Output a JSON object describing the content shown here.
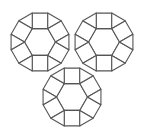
{
  "figure": {
    "title": "Trefoil arrangement of three rhombitrihexagonal rosettes",
    "background_color": "#ffffff",
    "stroke_color": "#555555",
    "stroke_width": 1.1,
    "fill_color": "#ffffff",
    "canvas": {
      "width": 144,
      "height": 140
    },
    "rosette_count": 3,
    "rosette_radius": 34,
    "hexagon_radius": 15.5,
    "rosettes": [
      {
        "name": "top-left-rosette",
        "cx": 40,
        "cy": 42,
        "rotation_deg": 0
      },
      {
        "name": "top-right-rosette",
        "cx": 104,
        "cy": 42,
        "rotation_deg": 0
      },
      {
        "name": "bottom-center-rosette",
        "cx": 72,
        "cy": 97,
        "rotation_deg": 0
      }
    ],
    "tiles_per_rosette": {
      "hexagon": 1,
      "squares": 6,
      "triangles": 6
    }
  },
  "chart_data": {
    "type": "diagram",
    "title": "Trefoil arrangement of three rhombitrihexagonal rosettes",
    "xlabel": "",
    "ylabel": "",
    "grid": false,
    "legend": "none",
    "units": [
      {
        "id": "top-left-rosette",
        "center": [
          40,
          42
        ],
        "hexagon_circumradius": 15.5,
        "ring_square_count": 6,
        "ring_triangle_count": 6
      },
      {
        "id": "top-right-rosette",
        "center": [
          104,
          42
        ],
        "hexagon_circumradius": 15.5,
        "ring_square_count": 6,
        "ring_triangle_count": 6
      },
      {
        "id": "bottom-center-rosette",
        "center": [
          72,
          97
        ],
        "hexagon_circumradius": 15.5,
        "ring_square_count": 6,
        "ring_triangle_count": 6
      }
    ]
  }
}
